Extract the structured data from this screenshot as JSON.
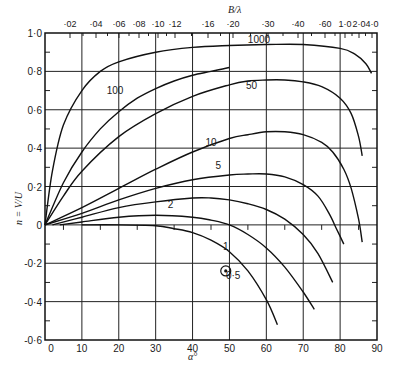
{
  "chart_data": {
    "type": "line",
    "title": "",
    "xlabel": "α°",
    "ylabel": "n = V/U",
    "top_axis_label": "B/λ",
    "xlim": [
      0,
      90
    ],
    "ylim": [
      -0.6,
      1.0
    ],
    "grid": true,
    "x_ticks": [
      "0",
      "10",
      "20",
      "30",
      "40",
      "50",
      "60",
      "70",
      "80",
      "90"
    ],
    "y_ticks": [
      "1·0",
      "0·8",
      "0·6",
      "0·4",
      "0·2",
      "0",
      "-0·2",
      "-0·4",
      "-0·6"
    ],
    "top_ticks": [
      {
        "label": "·02",
        "px": 70
      },
      {
        "label": "·04",
        "px": 96
      },
      {
        "label": "·06",
        "px": 119
      },
      {
        "label": "·08",
        "px": 139
      },
      {
        "label": "·10",
        "px": 158
      },
      {
        "label": "·12",
        "px": 175
      },
      {
        "label": "·16",
        "px": 208
      },
      {
        "label": "·20",
        "px": 233
      },
      {
        "label": "·30",
        "px": 268
      },
      {
        "label": "·40",
        "px": 298
      },
      {
        "label": "·60",
        "px": 325
      },
      {
        "label": "1·0",
        "px": 345
      },
      {
        "label": "2·0",
        "px": 359
      },
      {
        "label": "4·0",
        "px": 372
      }
    ],
    "series": [
      {
        "name": "1000",
        "label_pos": [
          58,
          0.95
        ],
        "x": [
          0,
          2,
          5,
          10,
          15,
          20,
          30,
          40,
          50,
          60,
          70,
          80,
          84,
          87,
          88.5
        ],
        "y": [
          0,
          0.28,
          0.52,
          0.7,
          0.8,
          0.85,
          0.9,
          0.925,
          0.935,
          0.94,
          0.94,
          0.92,
          0.89,
          0.84,
          0.79
        ]
      },
      {
        "name": "100",
        "label_pos": [
          19,
          0.68
        ],
        "x": [
          0,
          5,
          10,
          15,
          20,
          25,
          30,
          35,
          40,
          45,
          50
        ],
        "y": [
          0,
          0.22,
          0.38,
          0.5,
          0.59,
          0.66,
          0.71,
          0.75,
          0.78,
          0.8,
          0.82
        ]
      },
      {
        "name": "50",
        "label_pos": [
          56,
          0.71
        ],
        "x": [
          0,
          5,
          10,
          20,
          30,
          40,
          50,
          55,
          60,
          65,
          70,
          75,
          80,
          83,
          85,
          86
        ],
        "y": [
          0,
          0.15,
          0.28,
          0.46,
          0.58,
          0.67,
          0.73,
          0.75,
          0.755,
          0.755,
          0.745,
          0.72,
          0.66,
          0.58,
          0.46,
          0.36
        ]
      },
      {
        "name": "10",
        "label_pos": [
          45,
          0.41
        ],
        "x": [
          0,
          10,
          20,
          30,
          40,
          50,
          55,
          60,
          65,
          70,
          75,
          78,
          81,
          83,
          85,
          86
        ],
        "y": [
          0,
          0.09,
          0.19,
          0.29,
          0.38,
          0.45,
          0.47,
          0.485,
          0.485,
          0.47,
          0.43,
          0.38,
          0.29,
          0.19,
          0.03,
          -0.09
        ]
      },
      {
        "name": "5",
        "label_pos": [
          47,
          0.29
        ],
        "x": [
          0,
          10,
          20,
          30,
          40,
          50,
          55,
          60,
          65,
          70,
          74,
          77,
          79,
          81
        ],
        "y": [
          0,
          0.06,
          0.13,
          0.19,
          0.235,
          0.26,
          0.265,
          0.265,
          0.25,
          0.21,
          0.15,
          0.06,
          -0.02,
          -0.1
        ]
      },
      {
        "name": "2",
        "label_pos": [
          34,
          0.09
        ],
        "x": [
          2,
          10,
          20,
          30,
          40,
          45,
          50,
          55,
          60,
          65,
          70,
          74,
          78
        ],
        "y": [
          0,
          0.04,
          0.09,
          0.12,
          0.14,
          0.14,
          0.13,
          0.11,
          0.08,
          0.03,
          -0.05,
          -0.15,
          -0.3
        ]
      },
      {
        "name": "1",
        "label_pos": [
          49,
          -0.13
        ],
        "x": [
          4,
          10,
          20,
          30,
          40,
          45,
          50,
          55,
          60,
          65,
          70,
          73
        ],
        "y": [
          0,
          0.015,
          0.04,
          0.05,
          0.04,
          0.025,
          0.0,
          -0.05,
          -0.12,
          -0.22,
          -0.35,
          -0.44
        ]
      },
      {
        "name": "0·5",
        "label_pos": [
          51,
          -0.28
        ],
        "x": [
          10,
          20,
          30,
          35,
          40,
          45,
          50,
          55,
          60,
          63
        ],
        "y": [
          0.0,
          0.0,
          -0.005,
          -0.02,
          -0.04,
          -0.08,
          -0.14,
          -0.24,
          -0.39,
          -0.52
        ]
      }
    ],
    "annotations": [
      {
        "type": "circled-dot-marker",
        "x": 49,
        "y": -0.24
      }
    ]
  },
  "axes": {
    "x_title": "α°",
    "y_title": "n = V/U",
    "top_title": "B/λ"
  }
}
